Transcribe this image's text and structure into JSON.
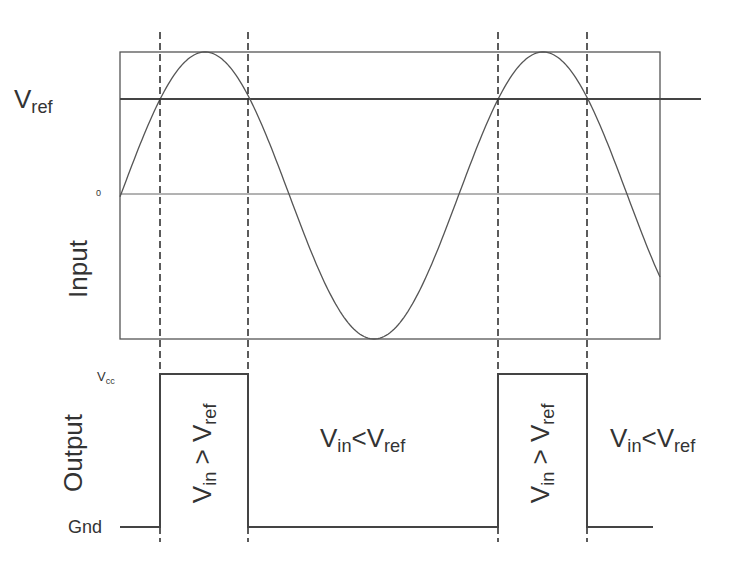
{
  "diagram": {
    "type": "comparator-timing-diagram",
    "stroke_color": "#555555",
    "sections": {
      "input": {
        "label": "Input",
        "ref_label_main": "V",
        "ref_label_sub": "ref",
        "zero_label": "0"
      },
      "output": {
        "label": "Output",
        "high_label_main": "V",
        "high_label_sub": "cc",
        "low_label": "Gnd"
      }
    },
    "regions": [
      {
        "id": "r1",
        "lhs": "V",
        "lhs_sub": "in",
        "op": ">",
        "rhs": "V",
        "rhs_sub": "ref",
        "orientation": "vertical",
        "output": "high"
      },
      {
        "id": "r2",
        "lhs": "V",
        "lhs_sub": "in",
        "op": "<",
        "rhs": "V",
        "rhs_sub": "ref",
        "orientation": "horizontal",
        "output": "low"
      },
      {
        "id": "r3",
        "lhs": "V",
        "lhs_sub": "in",
        "op": ">",
        "rhs": "V",
        "rhs_sub": "ref",
        "orientation": "vertical",
        "output": "high"
      },
      {
        "id": "r4",
        "lhs": "V",
        "lhs_sub": "in",
        "op": "<",
        "rhs": "V",
        "rhs_sub": "ref",
        "orientation": "horizontal",
        "output": "low"
      }
    ],
    "geometry": {
      "box": {
        "x1": 120,
        "y1": 52,
        "x2": 660,
        "y2": 339
      },
      "vref_y": 99,
      "vref_line_x1": 120,
      "vref_line_x2": 701,
      "zero_y": 194,
      "crossings_x": [
        160,
        248,
        498,
        587
      ],
      "dash_y1": 32,
      "dash_y2": 542,
      "vcc_y": 374,
      "gnd_y": 527,
      "output_x_start": 120,
      "output_x_end": 653
    }
  }
}
